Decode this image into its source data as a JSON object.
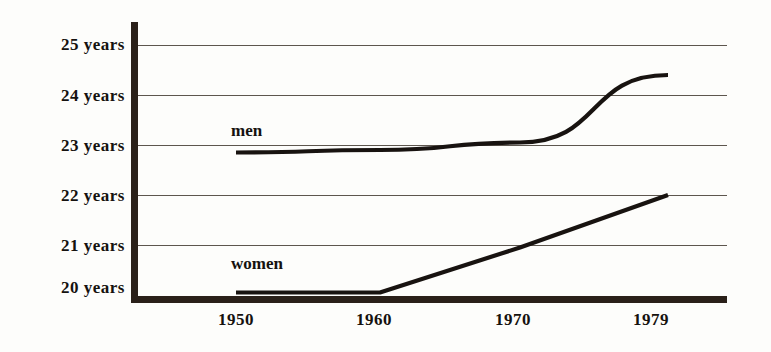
{
  "chart_data": {
    "type": "line",
    "title": "",
    "subtitle": "",
    "xlabel": "",
    "ylabel": "",
    "x": [
      1950,
      1960,
      1970,
      1979
    ],
    "categories": [
      "1950",
      "1960",
      "1970",
      "1979"
    ],
    "xtick_labels": [
      "1950",
      "1960",
      "1970",
      "1979"
    ],
    "ytick_labels": [
      "25 years",
      "24 years",
      "23 years",
      "22 years",
      "21 years",
      "20 years"
    ],
    "ytick_values": [
      25,
      24,
      23,
      22,
      21,
      20
    ],
    "ylim": [
      19.0,
      25.5
    ],
    "xlim": [
      1946,
      1982
    ],
    "grid": true,
    "legend_position": "inline-annotation",
    "series": [
      {
        "name": "men",
        "label": "men",
        "values": [
          22.85,
          22.9,
          23.05,
          24.4
        ],
        "color": "#181310"
      },
      {
        "name": "women",
        "label": "women",
        "values": [
          20.05,
          20.05,
          20.95,
          22.0
        ],
        "color": "#181310"
      }
    ],
    "annotations": [
      {
        "text": "men",
        "x": 1950,
        "y": 23.4
      },
      {
        "text": "women",
        "x": 1950,
        "y": 20.75
      }
    ]
  },
  "axis": {
    "y_labels": [
      {
        "text": "25 years",
        "value": 25
      },
      {
        "text": "24 years",
        "value": 24
      },
      {
        "text": "23 years",
        "value": 23
      },
      {
        "text": "22 years",
        "value": 22
      },
      {
        "text": "21 years",
        "value": 21
      },
      {
        "text": "20 years",
        "value": 20
      }
    ],
    "x_labels": [
      {
        "text": "1950"
      },
      {
        "text": "1960"
      },
      {
        "text": "1970"
      },
      {
        "text": "1979"
      }
    ]
  },
  "series_labels": {
    "men": "men",
    "women": "women"
  },
  "colors": {
    "background": "#fdfdfb",
    "axis": "#2a2019",
    "gridline": "#5d564e",
    "line": "#181310",
    "text": "#15120f"
  }
}
